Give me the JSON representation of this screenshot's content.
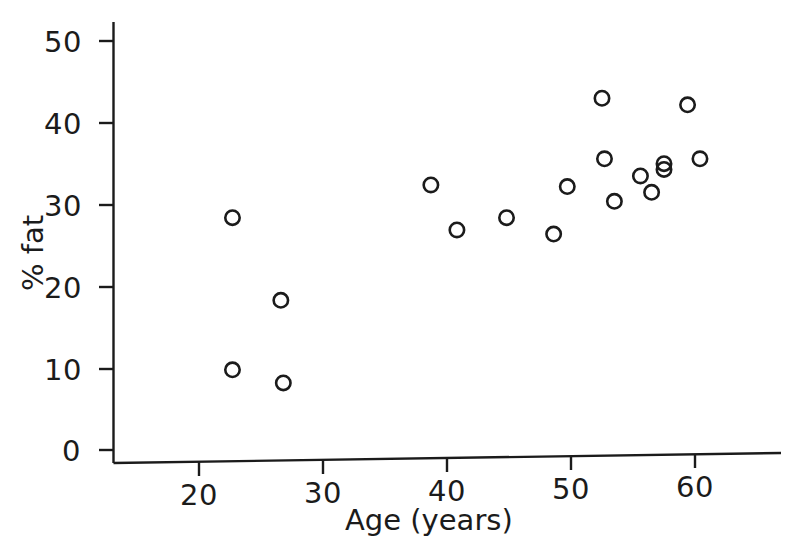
{
  "chart_data": {
    "type": "scatter",
    "title": "",
    "xlabel": "Age (years)",
    "ylabel": "% fat",
    "xlim": [
      14,
      68
    ],
    "ylim": [
      0,
      53
    ],
    "xticks": [
      20,
      30,
      40,
      50,
      60
    ],
    "yticks": [
      0,
      10,
      20,
      30,
      40,
      50
    ],
    "xtick_labels": [
      "20",
      "30",
      "40",
      "50",
      "60"
    ],
    "ytick_labels": [
      "0",
      "10",
      "20",
      "30",
      "40",
      "50"
    ],
    "grid": false,
    "legend": null,
    "marker": "open-circle",
    "marker_color": "#1b1b1b",
    "marker_fill": "none",
    "n_points": 18,
    "x": [
      22.7,
      26.6,
      22.7,
      26.8,
      38.7,
      40.8,
      44.8,
      48.6,
      49.7,
      52.5,
      52.7,
      53.5,
      55.6,
      56.5,
      57.5,
      57.5,
      59.4,
      60.4
    ],
    "y": [
      28.4,
      18.3,
      9.8,
      8.2,
      32.4,
      26.9,
      28.4,
      26.4,
      32.2,
      43.0,
      35.6,
      30.4,
      33.5,
      31.5,
      35.0,
      34.3,
      42.2,
      35.6
    ],
    "points": [
      {
        "x": 22.7,
        "y": 28.4
      },
      {
        "x": 26.6,
        "y": 18.3
      },
      {
        "x": 22.7,
        "y": 9.8
      },
      {
        "x": 26.8,
        "y": 8.2
      },
      {
        "x": 38.7,
        "y": 32.4
      },
      {
        "x": 40.8,
        "y": 26.9
      },
      {
        "x": 44.8,
        "y": 28.4
      },
      {
        "x": 48.6,
        "y": 26.4
      },
      {
        "x": 49.7,
        "y": 32.2
      },
      {
        "x": 52.5,
        "y": 43.0
      },
      {
        "x": 52.7,
        "y": 35.6
      },
      {
        "x": 53.5,
        "y": 30.4
      },
      {
        "x": 55.6,
        "y": 33.5
      },
      {
        "x": 56.5,
        "y": 31.5
      },
      {
        "x": 57.5,
        "y": 35.0
      },
      {
        "x": 57.5,
        "y": 34.3
      },
      {
        "x": 59.4,
        "y": 42.2
      },
      {
        "x": 60.4,
        "y": 35.6
      }
    ]
  },
  "axes": {
    "x_title": "Age (years)",
    "y_title": "% fat",
    "axis_color": "#1b1b1b"
  },
  "ticks": {
    "y": [
      {
        "label": "50"
      },
      {
        "label": "40"
      },
      {
        "label": "30"
      },
      {
        "label": "20"
      },
      {
        "label": "10"
      },
      {
        "label": "0"
      }
    ],
    "x": [
      {
        "label": "20"
      },
      {
        "label": "30"
      },
      {
        "label": "40"
      },
      {
        "label": "50"
      },
      {
        "label": "60"
      }
    ]
  }
}
